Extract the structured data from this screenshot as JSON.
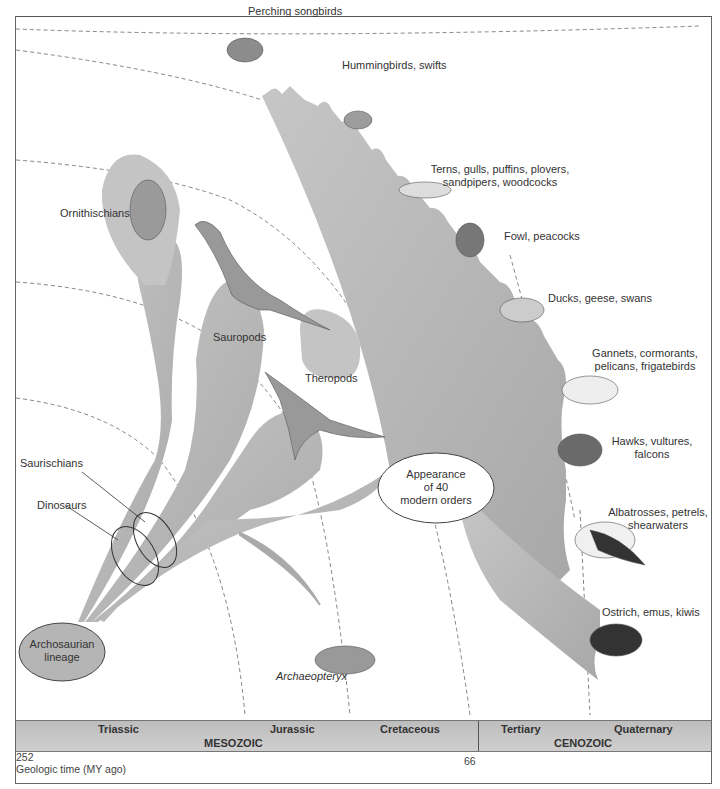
{
  "diagram": {
    "groups": {
      "archosaurian": "Archosaurian\nlineage",
      "archosaurian_line1": "Archosaurian",
      "archosaurian_line2": "lineage",
      "dinosaurs": "Dinosaurs",
      "saurischians": "Saurischians",
      "ornithischians": "Ornithischians",
      "sauropods": "Sauropods",
      "theropods": "Theropods",
      "archaeopteryx": "Archaeopteryx",
      "modern_orders_line1": "Appearance",
      "modern_orders_line2": "of 40",
      "modern_orders_line3": "modern orders"
    },
    "bird_orders": [
      {
        "line1": "Perching songbirds",
        "line2": ""
      },
      {
        "line1": "Hummingbirds, swifts",
        "line2": ""
      },
      {
        "line1": "Terns, gulls, puffins, plovers,",
        "line2": "sandpipers, woodcocks"
      },
      {
        "line1": "Fowl, peacocks",
        "line2": ""
      },
      {
        "line1": "Ducks, geese, swans",
        "line2": ""
      },
      {
        "line1": "Gannets, cormorants,",
        "line2": "pelicans, frigatebirds"
      },
      {
        "line1": "Hawks, vultures,",
        "line2": "falcons"
      },
      {
        "line1": "Albatrosses, petrels,",
        "line2": "shearwaters"
      },
      {
        "line1": "Ostrich, emus, kiwis",
        "line2": ""
      }
    ],
    "timescale": {
      "periods": [
        "Triassic",
        "Jurassic",
        "Cretaceous",
        "Tertiary",
        "Quaternary"
      ],
      "eras": [
        "MESOZOIC",
        "CENOZOIC"
      ],
      "ticks": [
        "252",
        "66"
      ],
      "axis_label": "Geologic time (MY ago)"
    },
    "colors": {
      "branch_fill": "#b8b8b8",
      "branch_dark": "#a6a6a6",
      "timebar": "#c4c4c4",
      "outline": "#444444"
    }
  }
}
